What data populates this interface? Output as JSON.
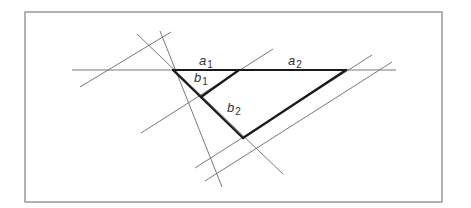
{
  "diagram": {
    "type": "geometric-construction",
    "colors": {
      "background": "#ffffff",
      "frame": "#8a8a8a",
      "thin_line": "#6a6a6a",
      "thick_line": "#1a1a1a",
      "label": "#333333"
    },
    "labels": [
      {
        "id": "a1",
        "base": "a",
        "sub": "1"
      },
      {
        "id": "a2",
        "base": "a",
        "sub": "2"
      },
      {
        "id": "b1",
        "base": "b",
        "sub": "1"
      },
      {
        "id": "b2",
        "base": "b",
        "sub": "2"
      }
    ]
  }
}
